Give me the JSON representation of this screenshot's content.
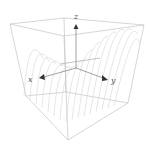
{
  "figure": {
    "axes": {
      "x_label": "x",
      "y_label": "y",
      "z_label": "z"
    },
    "colors": {
      "box": "#c4c4c4",
      "surface": "#d2d2d2",
      "axis": "#7a7a7a",
      "arrowhead": "#333333",
      "label": "#555555"
    }
  }
}
